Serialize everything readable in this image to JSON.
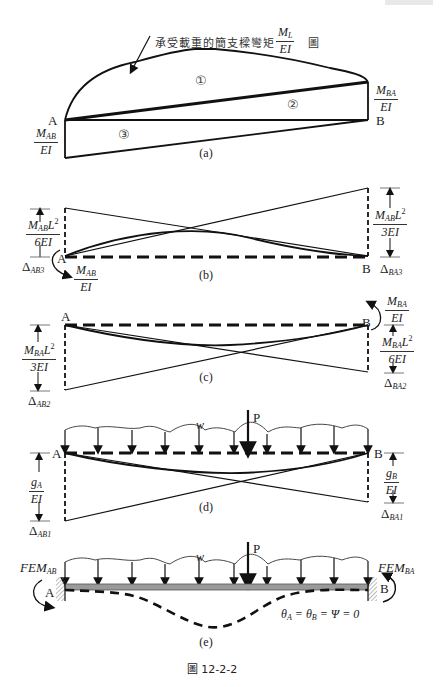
{
  "figure": {
    "caption": "圖 12-2-2",
    "header_fragment_visible": true
  },
  "panel_a": {
    "label": "(a)",
    "annotation": "承受載重的簡支樑彎矩",
    "annotation_frac": {
      "num": "M",
      "num_sub": "L",
      "den": "EI"
    },
    "annotation_suffix": "圖",
    "node_A": "A",
    "node_B": "B",
    "regions": [
      "①",
      "②",
      "③"
    ],
    "left_frac": {
      "num": "M",
      "num_sub": "AB",
      "den": "EI"
    },
    "right_frac": {
      "num": "M",
      "num_sub": "BA",
      "den": "EI"
    }
  },
  "panel_b": {
    "label": "(b)",
    "node_A": "A",
    "node_B": "B",
    "left_frac": {
      "num": "M",
      "num_sub": "AB",
      "num_tail": "L",
      "num_sup": "2",
      "den": "6EI"
    },
    "left_delta": {
      "sym": "Δ",
      "sub": "AB3"
    },
    "moment_frac": {
      "num": "M",
      "num_sub": "AB",
      "den": "EI"
    },
    "right_frac": {
      "num": "M",
      "num_sub": "AB",
      "num_tail": "L",
      "num_sup": "2",
      "den": "3EI"
    },
    "right_delta": {
      "sym": "Δ",
      "sub": "BA3"
    }
  },
  "panel_c": {
    "label": "(c)",
    "node_A": "A",
    "node_B": "B",
    "left_frac": {
      "num": "M",
      "num_sub": "BA",
      "num_tail": "L",
      "num_sup": "2",
      "den": "3EI"
    },
    "left_delta": {
      "sym": "Δ",
      "sub": "AB2"
    },
    "moment_frac": {
      "num": "M",
      "num_sub": "BA",
      "den": "EI"
    },
    "right_frac": {
      "num": "M",
      "num_sub": "BA",
      "num_tail": "L",
      "num_sup": "2",
      "den": "6EI"
    },
    "right_delta": {
      "sym": "Δ",
      "sub": "BA2"
    }
  },
  "panel_d": {
    "label": "(d)",
    "node_A": "A",
    "node_B": "B",
    "load_w": "w",
    "load_P": "P",
    "left_frac": {
      "num": "g",
      "num_sub": "A",
      "den": "EI"
    },
    "left_delta": {
      "sym": "Δ",
      "sub": "AB1"
    },
    "right_frac": {
      "num": "g",
      "num_sub": "B",
      "den": "EI"
    },
    "right_delta": {
      "sym": "Δ",
      "sub": "BA1"
    }
  },
  "panel_e": {
    "label": "(e)",
    "node_A": "A",
    "node_B": "B",
    "load_w": "w",
    "load_P": "P",
    "fem_left": {
      "main": "FEM",
      "sub": "AB"
    },
    "fem_right": {
      "main": "FEM",
      "sub": "BA"
    },
    "condition": "θ_A = θ_B = Ψ = 0",
    "condition_parts": {
      "t1": "θ",
      "s1": "A",
      "t2": " = θ",
      "s2": "B",
      "t3": " = Ψ = 0"
    }
  },
  "colors": {
    "line": "#111111",
    "beam_fill": "#9a9a9a",
    "hatch": "#888888"
  }
}
